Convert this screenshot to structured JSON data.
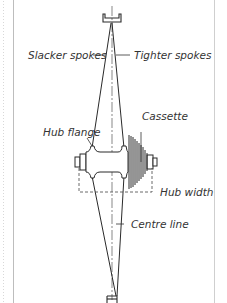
{
  "diagram": {
    "type": "bicycle wheel dish cross-section",
    "labels": {
      "slacker_spokes": "Slacker spokes",
      "tighter_spokes": "Tighter spokes",
      "cassette": "Cassette",
      "hub_flange": "Hub flange",
      "hub_width": "Hub width",
      "centre_line": "Centre line"
    },
    "colors": {
      "line": "#2a2a2a",
      "frame_border": "#bdbdbd",
      "text": "#333333"
    }
  }
}
